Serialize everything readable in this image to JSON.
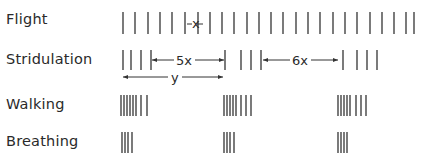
{
  "diagram": {
    "rows": [
      {
        "label": "Flight",
        "y_top": 12,
        "y_bottom": 34
      },
      {
        "label": "Stridulation",
        "y_top": 50,
        "y_bottom": 70
      },
      {
        "label": "Walking",
        "y_top": 95,
        "y_bottom": 116
      },
      {
        "label": "Breathing",
        "y_top": 132,
        "y_bottom": 153
      }
    ],
    "flight_ticks": [
      123,
      135,
      148,
      160,
      172,
      185,
      198,
      210,
      222,
      234,
      247,
      259,
      271,
      283,
      296,
      308,
      320,
      333,
      345,
      357,
      370,
      382,
      394,
      406,
      414
    ],
    "flight_interval_label": "x",
    "stridulation_groups": [
      [
        123,
        131,
        141,
        151
      ],
      [
        225,
        241,
        251,
        261
      ],
      [
        343,
        357,
        367,
        377
      ]
    ],
    "stridulation_gap_labels": [
      "5x",
      "6x"
    ],
    "stridulation_period_label": "y",
    "walking_groups": [
      [
        121,
        124,
        127,
        130,
        133,
        136,
        141,
        147
      ],
      [
        224,
        227,
        230,
        233,
        236,
        241,
        246,
        251
      ],
      [
        338,
        341,
        344,
        347,
        350,
        356,
        361,
        366
      ]
    ],
    "breathing_groups": [
      [
        122,
        125,
        128,
        132
      ],
      [
        224,
        227,
        230,
        234
      ],
      [
        338,
        341,
        344,
        347
      ]
    ],
    "line_color": "#333333"
  }
}
